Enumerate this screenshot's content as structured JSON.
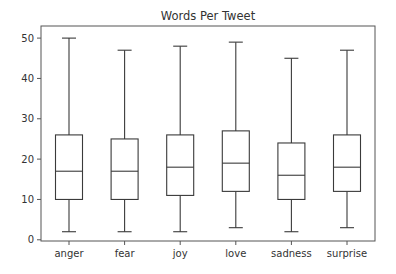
{
  "chart_data": {
    "type": "boxplot",
    "title": "Words Per Tweet",
    "xlabel": "",
    "ylabel": "",
    "categories": [
      "anger",
      "fear",
      "joy",
      "love",
      "sadness",
      "surprise"
    ],
    "series": [
      {
        "name": "anger",
        "whisker_low": 2,
        "q1": 10,
        "median": 17,
        "q3": 26,
        "whisker_high": 50
      },
      {
        "name": "fear",
        "whisker_low": 2,
        "q1": 10,
        "median": 17,
        "q3": 25,
        "whisker_high": 47
      },
      {
        "name": "joy",
        "whisker_low": 2,
        "q1": 11,
        "median": 18,
        "q3": 26,
        "whisker_high": 48
      },
      {
        "name": "love",
        "whisker_low": 3,
        "q1": 12,
        "median": 19,
        "q3": 27,
        "whisker_high": 49
      },
      {
        "name": "sadness",
        "whisker_low": 2,
        "q1": 10,
        "median": 16,
        "q3": 24,
        "whisker_high": 45
      },
      {
        "name": "surprise",
        "whisker_low": 3,
        "q1": 12,
        "median": 18,
        "q3": 26,
        "whisker_high": 47
      }
    ],
    "yticks": [
      0,
      10,
      20,
      30,
      40,
      50
    ],
    "ylim": [
      -0.3,
      53
    ],
    "grid": false,
    "legend": null,
    "colors": {
      "line": "#3a3a3a",
      "background": "#ffffff",
      "spine": "#555555"
    }
  }
}
